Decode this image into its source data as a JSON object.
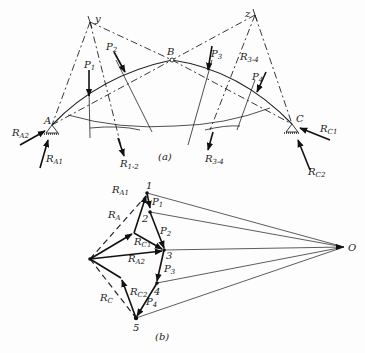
{
  "figure": {
    "part_a": {
      "caption": "(a)",
      "points": {
        "A": "A",
        "B": "B",
        "C": "C",
        "y": "y",
        "z": "z"
      },
      "loads": [
        "P1",
        "P2",
        "P3",
        "P4"
      ],
      "resultants": [
        "R1-2",
        "R3-4",
        "R3-4"
      ],
      "reactions": [
        "RA2",
        "RA1",
        "RC1",
        "RC2"
      ]
    },
    "part_b": {
      "caption": "(b)",
      "nodes": [
        "1",
        "2",
        "3",
        "4",
        "5",
        "O"
      ],
      "vectors": [
        "RA1",
        "RA",
        "RC1",
        "RA2",
        "RC2",
        "RC",
        "P1",
        "P2",
        "P3",
        "P4"
      ]
    }
  },
  "labels": {
    "y": "y",
    "z": "z",
    "A": "A",
    "B": "B",
    "C": "C",
    "P": "P",
    "R": "R",
    "p1": "1",
    "p2": "2",
    "p3": "3",
    "p4": "4",
    "r12": "1-2",
    "r34": "3-4",
    "a2": "A2",
    "a1": "A1",
    "c1": "C1",
    "c2": "C2",
    "sA": "A",
    "sC": "C",
    "n1": "1",
    "n2": "2",
    "n3": "3",
    "n4": "4",
    "n5": "5",
    "O": "O",
    "capA": "(a)",
    "capB": "(b)"
  }
}
